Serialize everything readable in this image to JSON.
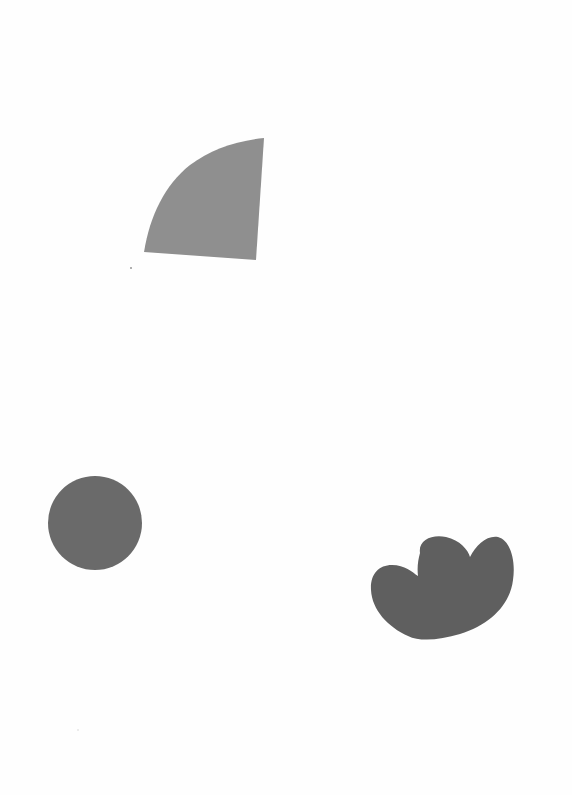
{
  "page": {
    "background": "#fefefe",
    "width": 572,
    "height": 795
  },
  "shapes": [
    {
      "id": "quarter-fan",
      "type": "quarter-circle",
      "fill": "#8f8f8f",
      "description": "light gray quarter-circle fan shape, flat bottom and right edges, curved top-left arc"
    },
    {
      "id": "circle",
      "type": "circle",
      "fill": "#6a6a6a",
      "cx": 95,
      "cy": 523,
      "r": 47,
      "description": "medium-dark gray circle"
    },
    {
      "id": "cloud-blob",
      "type": "blob",
      "fill": "#5f5f5f",
      "description": "dark gray cloud-like blob with three rounded lobes on top"
    }
  ],
  "specks": [
    {
      "x": 131,
      "y": 268,
      "fill": "#b0b0b0"
    },
    {
      "x": 78,
      "y": 729,
      "fill": "#ececec"
    }
  ]
}
